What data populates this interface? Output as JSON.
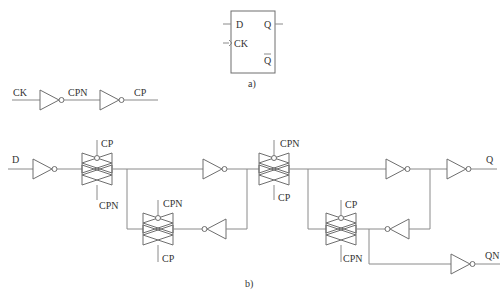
{
  "figure_a": {
    "caption": "a)",
    "pins": {
      "d": "D",
      "ck": "CK",
      "q": "Q",
      "qbar": "Q"
    }
  },
  "clock_buffer": {
    "input": "CK",
    "mid": "CPN",
    "output": "CP"
  },
  "figure_b": {
    "caption": "b)",
    "input": "D",
    "outputs": {
      "q": "Q",
      "qn": "QN"
    },
    "tg_labels": {
      "tg1_top": "CP",
      "tg1_bottom": "CPN",
      "tg2_top": "CPN",
      "tg2_bottom": "CP",
      "tg3_top": "CPN",
      "tg3_bottom": "CP",
      "tg4_top": "CP",
      "tg4_bottom": "CPN"
    }
  },
  "colors": {
    "wire": "#8a8a8a",
    "gate": "#6e6e6e",
    "text": "#333333"
  }
}
